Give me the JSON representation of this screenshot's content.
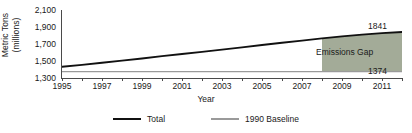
{
  "chart_data": {
    "type": "line",
    "title": "",
    "xlabel": "Year",
    "ylabel": "Metric Tons (millions)",
    "ylabel_line1": "Metric Tons",
    "ylabel_line2": "(millions)",
    "xlim": [
      1995,
      2012
    ],
    "ylim": [
      1300,
      2100
    ],
    "ytick_labels": [
      "2,100",
      "1,900",
      "1,700",
      "1,500",
      "1,300"
    ],
    "ytick_values": [
      2100,
      1900,
      1700,
      1500,
      1300
    ],
    "xtick_labels": [
      "1995",
      "1997",
      "1999",
      "2001",
      "2003",
      "2005",
      "2007",
      "2009",
      "2011"
    ],
    "xtick_values": [
      1995,
      1997,
      1999,
      2001,
      2003,
      2005,
      2007,
      2009,
      2011
    ],
    "grid": false,
    "legend_position": "bottom",
    "x": [
      1995,
      1996,
      1997,
      1998,
      1999,
      2000,
      2001,
      2002,
      2003,
      2004,
      2005,
      2006,
      2007,
      2008,
      2009,
      2010,
      2011,
      2012
    ],
    "series": [
      {
        "name": "Total",
        "color": "#111111",
        "values": [
          1432,
          1455,
          1480,
          1505,
          1530,
          1557,
          1583,
          1608,
          1634,
          1660,
          1688,
          1714,
          1740,
          1766,
          1790,
          1810,
          1828,
          1841
        ]
      },
      {
        "name": "1990 Baseline",
        "color": "#9a9a9a",
        "values": [
          1374,
          1374,
          1374,
          1374,
          1374,
          1374,
          1374,
          1374,
          1374,
          1374,
          1374,
          1374,
          1374,
          1374,
          1374,
          1374,
          1374,
          1374
        ]
      }
    ],
    "annotations": [
      {
        "name": "emissions-gap",
        "text": "Emissions Gap",
        "fill": "#a3ab98",
        "x_start": 2008,
        "x_end": 2012
      },
      {
        "name": "total-endpoint-value",
        "text": "1841",
        "value": 1841
      },
      {
        "name": "baseline-value",
        "text": "1374",
        "value": 1374
      }
    ]
  },
  "legend": {
    "items": [
      {
        "label": "Total",
        "swatch": "thick-black-line"
      },
      {
        "label": "1990 Baseline",
        "swatch": "thin-gray-line"
      }
    ]
  }
}
